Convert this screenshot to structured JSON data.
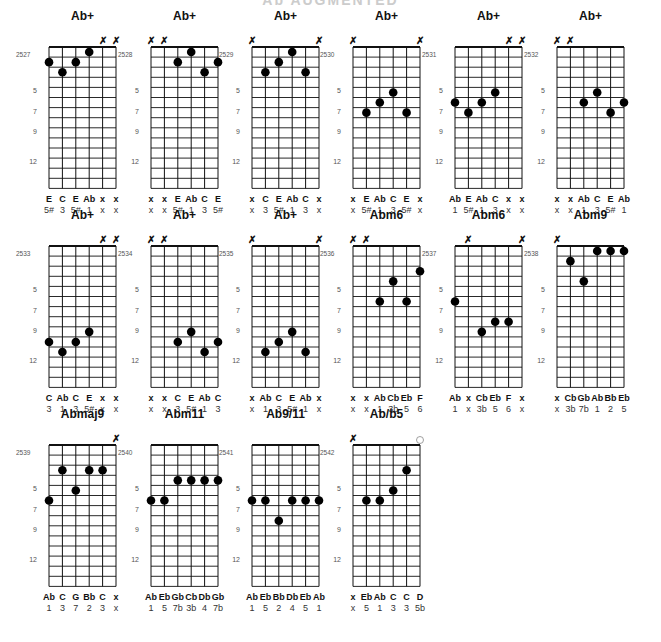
{
  "header": {
    "title": "Ab AUGMENTED"
  },
  "fret_markers": [
    "5",
    "7",
    "9",
    "12"
  ],
  "chords": [
    {
      "name": "Ab+",
      "id": "2527",
      "muted_top": [
        4,
        5
      ],
      "open_top": [],
      "dots": [
        [
          0,
          2
        ],
        [
          1,
          3
        ],
        [
          2,
          2
        ],
        [
          3,
          1
        ]
      ],
      "notes": [
        "E",
        "C",
        "E",
        "Ab",
        "x",
        "x"
      ],
      "intervals": [
        "5#",
        "3",
        "5#",
        "1",
        "x",
        "x"
      ]
    },
    {
      "name": "Ab+",
      "id": "2528",
      "muted_top": [
        0,
        1
      ],
      "open_top": [],
      "dots": [
        [
          2,
          2
        ],
        [
          3,
          1
        ],
        [
          4,
          3
        ],
        [
          5,
          2
        ]
      ],
      "notes": [
        "x",
        "x",
        "E",
        "Ab",
        "C",
        "E"
      ],
      "intervals": [
        "x",
        "x",
        "5#",
        "1",
        "3",
        "5#"
      ]
    },
    {
      "name": "Ab+",
      "id": "2529",
      "muted_top": [
        0,
        5
      ],
      "open_top": [],
      "dots": [
        [
          1,
          3
        ],
        [
          2,
          2
        ],
        [
          3,
          1
        ],
        [
          4,
          3
        ]
      ],
      "notes": [
        "x",
        "C",
        "E",
        "Ab",
        "C",
        "x"
      ],
      "intervals": [
        "x",
        "3",
        "5#",
        "1",
        "3",
        "x"
      ]
    },
    {
      "name": "Ab+",
      "id": "2530",
      "muted_top": [
        0,
        5
      ],
      "open_top": [],
      "dots": [
        [
          1,
          7
        ],
        [
          2,
          6
        ],
        [
          3,
          5
        ],
        [
          4,
          7
        ]
      ],
      "notes": [
        "x",
        "E",
        "Ab",
        "C",
        "E",
        "x"
      ],
      "intervals": [
        "x",
        "5#",
        "1",
        "3",
        "5#",
        "x"
      ]
    },
    {
      "name": "Ab+",
      "id": "2531",
      "muted_top": [
        4,
        5
      ],
      "open_top": [],
      "dots": [
        [
          0,
          6
        ],
        [
          1,
          7
        ],
        [
          2,
          6
        ],
        [
          3,
          5
        ]
      ],
      "notes": [
        "Ab",
        "E",
        "Ab",
        "C",
        "x",
        "x"
      ],
      "intervals": [
        "1",
        "5#",
        "1",
        "3",
        "x",
        "x"
      ]
    },
    {
      "name": "Ab+",
      "id": "2532",
      "muted_top": [
        0,
        1
      ],
      "open_top": [],
      "dots": [
        [
          2,
          6
        ],
        [
          3,
          5
        ],
        [
          4,
          7
        ],
        [
          5,
          6
        ]
      ],
      "notes": [
        "x",
        "x",
        "Ab",
        "C",
        "E",
        "Ab"
      ],
      "intervals": [
        "x",
        "x",
        "1",
        "3",
        "5#",
        "1"
      ]
    },
    {
      "name": "Ab+",
      "id": "2533",
      "muted_top": [
        4,
        5
      ],
      "open_top": [],
      "dots": [
        [
          0,
          10
        ],
        [
          1,
          11
        ],
        [
          2,
          10
        ],
        [
          3,
          9
        ]
      ],
      "notes": [
        "C",
        "Ab",
        "C",
        "E",
        "x",
        "x"
      ],
      "intervals": [
        "3",
        "1",
        "3",
        "5#",
        "x",
        "x"
      ]
    },
    {
      "name": "Ab+",
      "id": "2534",
      "muted_top": [
        0,
        1
      ],
      "open_top": [],
      "dots": [
        [
          2,
          10
        ],
        [
          3,
          9
        ],
        [
          4,
          11
        ],
        [
          5,
          10
        ]
      ],
      "notes": [
        "x",
        "x",
        "C",
        "E",
        "Ab",
        "C"
      ],
      "intervals": [
        "x",
        "x",
        "3",
        "5#",
        "1",
        "3"
      ]
    },
    {
      "name": "Ab+",
      "id": "2535",
      "muted_top": [
        0,
        5
      ],
      "open_top": [],
      "dots": [
        [
          1,
          11
        ],
        [
          2,
          10
        ],
        [
          3,
          9
        ],
        [
          4,
          11
        ]
      ],
      "notes": [
        "x",
        "Ab",
        "C",
        "E",
        "Ab",
        "x"
      ],
      "intervals": [
        "x",
        "1",
        "3",
        "5#",
        "1",
        "x"
      ]
    },
    {
      "name": "Abm6",
      "id": "2536",
      "muted_top": [
        0,
        1
      ],
      "open_top": [],
      "dots": [
        [
          2,
          6
        ],
        [
          3,
          4
        ],
        [
          4,
          6
        ],
        [
          5,
          3
        ]
      ],
      "notes": [
        "x",
        "x",
        "Ab",
        "Cb",
        "Eb",
        "F"
      ],
      "intervals": [
        "x",
        "x",
        "1",
        "3b",
        "5",
        "6"
      ]
    },
    {
      "name": "Abm6",
      "id": "2537",
      "muted_top": [
        1,
        5
      ],
      "open_top": [],
      "dots": [
        [
          0,
          6
        ],
        [
          2,
          9
        ],
        [
          3,
          8
        ],
        [
          4,
          8
        ]
      ],
      "notes": [
        "Ab",
        "x",
        "Cb",
        "Eb",
        "F",
        "x"
      ],
      "intervals": [
        "1",
        "x",
        "3b",
        "5",
        "6",
        "x"
      ]
    },
    {
      "name": "Abm9",
      "id": "2538",
      "muted_top": [
        0
      ],
      "open_top": [],
      "dots": [
        [
          1,
          2
        ],
        [
          2,
          4
        ],
        [
          3,
          1
        ],
        [
          4,
          1
        ],
        [
          5,
          1
        ]
      ],
      "notes": [
        "x",
        "Cb",
        "Gb",
        "Ab",
        "Bb",
        "Eb"
      ],
      "intervals": [
        "x",
        "3b",
        "7b",
        "1",
        "2",
        "5"
      ]
    },
    {
      "name": "Abmaj9",
      "id": "2539",
      "muted_top": [
        5
      ],
      "open_top": [],
      "dots": [
        [
          0,
          6
        ],
        [
          1,
          3
        ],
        [
          2,
          5
        ],
        [
          3,
          3
        ],
        [
          4,
          3
        ]
      ],
      "notes": [
        "Ab",
        "C",
        "G",
        "Bb",
        "C",
        "x"
      ],
      "intervals": [
        "1",
        "3",
        "7",
        "2",
        "3",
        "x"
      ]
    },
    {
      "name": "Abm11",
      "id": "2540",
      "muted_top": [],
      "open_top": [],
      "dots": [
        [
          0,
          6
        ],
        [
          1,
          6
        ],
        [
          2,
          4
        ],
        [
          3,
          4
        ],
        [
          4,
          4
        ],
        [
          5,
          4
        ]
      ],
      "notes": [
        "Ab",
        "Eb",
        "Gb",
        "Cb",
        "Db",
        "Gb"
      ],
      "intervals": [
        "1",
        "5",
        "7b",
        "3b",
        "4",
        "7b"
      ]
    },
    {
      "name": "Ab9/11",
      "id": "2541",
      "muted_top": [],
      "open_top": [],
      "dots": [
        [
          0,
          6
        ],
        [
          1,
          6
        ],
        [
          2,
          8
        ],
        [
          3,
          6
        ],
        [
          4,
          6
        ],
        [
          5,
          6
        ]
      ],
      "notes": [
        "Ab",
        "Eb",
        "Bb",
        "Db",
        "Eb",
        "Ab"
      ],
      "intervals": [
        "1",
        "5",
        "2",
        "4",
        "5",
        "1"
      ]
    },
    {
      "name": "Ab/b5",
      "id": "2542",
      "muted_top": [
        0
      ],
      "open_top": [
        5
      ],
      "dots": [
        [
          1,
          6
        ],
        [
          2,
          6
        ],
        [
          3,
          5
        ],
        [
          4,
          3
        ]
      ],
      "notes": [
        "x",
        "Eb",
        "Ab",
        "C",
        "C",
        "D"
      ],
      "intervals": [
        "x",
        "5",
        "1",
        "3",
        "3",
        "5b"
      ]
    }
  ],
  "layout": {
    "columns_x": [
      49,
      151,
      252,
      353,
      455,
      557
    ],
    "rows_nut_y": [
      47,
      246,
      445
    ],
    "string_spacing": 13.4,
    "fret_spacing": 10.1,
    "num_frets": 14
  }
}
